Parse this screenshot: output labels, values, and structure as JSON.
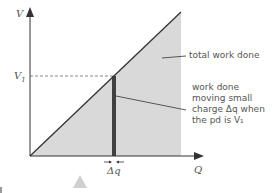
{
  "diagram": {
    "y_axis_label": "V",
    "x_axis_label": "Q",
    "v1_label": "V",
    "v1_subscript": "1",
    "annotation_total": "total work done",
    "annotation_small": [
      "work done",
      "moving small",
      "charge Δq when",
      "the pd is V₁"
    ],
    "delta_q_label": "Δq",
    "colors": {
      "shade": "#d9d9d9",
      "line": "#333333",
      "bar": "#404040",
      "dashed": "#888888",
      "text": "#555555",
      "marker": "#d0d0d0"
    }
  }
}
